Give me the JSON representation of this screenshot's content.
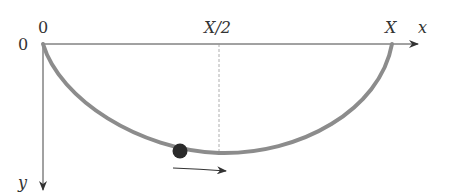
{
  "diagram": {
    "labels": {
      "origin_top": "0",
      "origin_left": "0",
      "half_x": "X/2",
      "full_x": "X",
      "x_axis": "x",
      "y_axis": "y"
    },
    "colors": {
      "axis": "#444444",
      "curve": "#8c8c8c",
      "ball": "#2a2a2a",
      "dashed": "#999999"
    }
  }
}
